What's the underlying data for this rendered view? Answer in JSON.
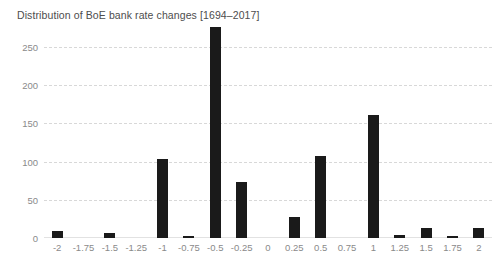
{
  "chart_data": {
    "type": "bar",
    "title": "Distribution of BoE bank rate changes [1694–2017]",
    "xlabel": "",
    "ylabel": "",
    "categories": [
      "-2",
      "-1.75",
      "-1.5",
      "-1.25",
      "-1",
      "-0.75",
      "-0.5",
      "-0.25",
      "0",
      "0.25",
      "0.5",
      "0.75",
      "1",
      "1.25",
      "1.5",
      "1.75",
      "2"
    ],
    "values": [
      9,
      0,
      6,
      0,
      103,
      2,
      276,
      73,
      0,
      28,
      107,
      0,
      161,
      4,
      13,
      2,
      13
    ],
    "ylim": [
      0,
      275
    ],
    "yticks": [
      0,
      50,
      100,
      150,
      200,
      250
    ],
    "ytick_labels": [
      "0",
      "50",
      "100",
      "150",
      "200",
      "250"
    ],
    "grid": true,
    "grid_axis": "y",
    "legend": false,
    "bar_color": "#1a1a1a",
    "grid_color": "#d8d8d8",
    "tick_label_color": "#8a8a8a",
    "title_color": "#4d4d4d",
    "background_color": "#ffffff"
  }
}
